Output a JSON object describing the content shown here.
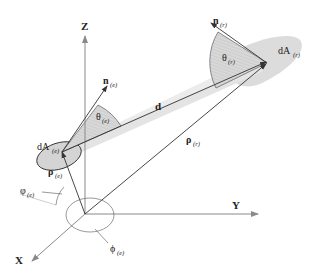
{
  "diagram": {
    "type": "3D geometry of radiative exchange between two differential areas",
    "axes": {
      "z": {
        "label": "Z"
      },
      "y": {
        "label": "Y"
      },
      "x": {
        "label": "X"
      }
    },
    "emitter": {
      "area_label": "dA",
      "area_sub": "(e)",
      "normal_label": "n",
      "normal_sub": "(e)",
      "theta_label": "θ",
      "theta_sub": "(e)",
      "position_label": "ρ",
      "position_sub": "(e)",
      "polar_angle_label": "φ",
      "polar_angle_sub": "(e)",
      "azimuth_label": "ϕ",
      "azimuth_sub": "(e)"
    },
    "receiver": {
      "area_label": "dA",
      "area_sub": "(r)",
      "normal_label": "n",
      "normal_sub": "(r)",
      "theta_label": "θ",
      "theta_sub": "(r)",
      "position_label": "ρ",
      "position_sub": "(r)"
    },
    "distance_vector": {
      "label": "d"
    },
    "colors": {
      "axis": "#8a8a8a",
      "surface_fill": "#d4d4d4",
      "beam_fill": "#e2e2e2",
      "hatch": "#b8b8b8",
      "ink": "#222222"
    }
  }
}
